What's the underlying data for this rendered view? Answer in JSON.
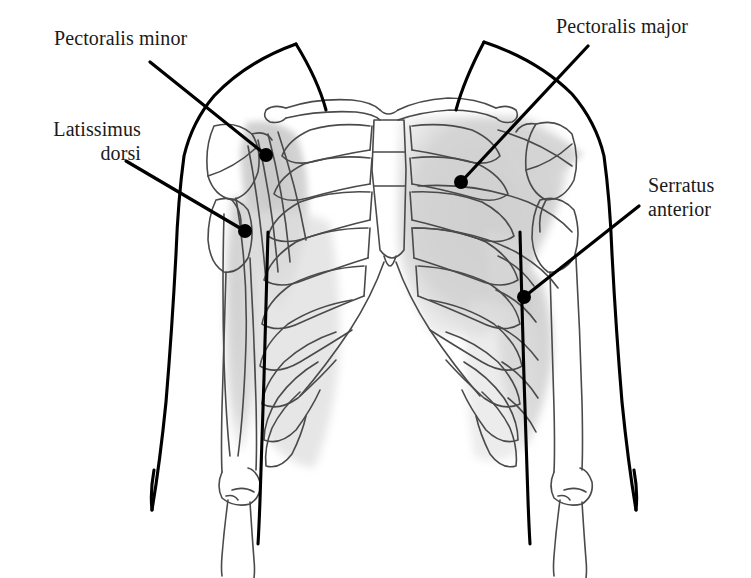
{
  "figure": {
    "background_color": "#ffffff",
    "width": 751,
    "height": 578
  },
  "style": {
    "outline_color": "#000000",
    "bone_line_color": "#4a4a4a",
    "muscle_shade_color": "#d0d0d0",
    "muscle_shade_color_light": "#dcdcdc",
    "leader_color": "#000000",
    "text_color": "#1a1a1a"
  },
  "labels": [
    {
      "id": "pectoralis-minor",
      "text": "Pectoralis minor",
      "lines": [
        "Pectoralis minor"
      ],
      "align": "left",
      "text_x": 54,
      "text_y": 27,
      "leader": {
        "x1": 150,
        "y1": 62,
        "x2": 266,
        "y2": 155
      },
      "dot": {
        "cx": 266,
        "cy": 155,
        "r": 7
      }
    },
    {
      "id": "latissimus-dorsi",
      "text": "Latissimus dorsi",
      "lines": [
        "Latissimus",
        "dorsi"
      ],
      "align": "right",
      "text_x": 26,
      "text_y": 118,
      "leader": {
        "x1": 126,
        "y1": 161,
        "x2": 245,
        "y2": 231
      },
      "dot": {
        "cx": 245,
        "cy": 231,
        "r": 7
      }
    },
    {
      "id": "pectoralis-major",
      "text": "Pectoralis major",
      "lines": [
        "Pectoralis major"
      ],
      "align": "left",
      "text_x": 556,
      "text_y": 15,
      "leader": {
        "x1": 588,
        "y1": 46,
        "x2": 461,
        "y2": 182
      },
      "dot": {
        "cx": 461,
        "cy": 182,
        "r": 7
      }
    },
    {
      "id": "serratus-anterior",
      "text": "Serratus anterior",
      "lines": [
        "Serratus",
        "anterior"
      ],
      "align": "left",
      "text_x": 648,
      "text_y": 174,
      "leader": {
        "x1": 639,
        "y1": 206,
        "x2": 524,
        "y2": 297
      },
      "dot": {
        "cx": 524,
        "cy": 297,
        "r": 7
      }
    }
  ],
  "anatomy": {
    "structures": [
      "body-outline",
      "clavicle-left",
      "clavicle-right",
      "scapula-left",
      "scapula-right",
      "humerus-left",
      "humerus-right",
      "radius-ulna-left",
      "radius-ulna-right",
      "rib-cage-left",
      "rib-cage-right",
      "sternum",
      "costal-arch"
    ],
    "shaded_muscles": [
      "pectoralis-minor-shade",
      "latissimus-dorsi-shade",
      "pectoralis-major-shade",
      "serratus-anterior-shade"
    ],
    "rib_count_per_side": 9
  }
}
